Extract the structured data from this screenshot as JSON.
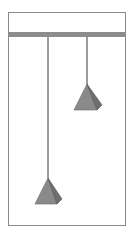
{
  "diagram": {
    "colors": {
      "frame": "#8a8a8a",
      "bar": "#8c8c8c",
      "string": "#3a3a3a",
      "pyramid_face": "#8a8a8a",
      "pyramid_side": "#6e6e6e",
      "pyramid_edge": "#555555"
    },
    "weights": [
      {
        "name": "left-weight",
        "relative_hang": "long"
      },
      {
        "name": "right-weight",
        "relative_hang": "short"
      }
    ]
  }
}
